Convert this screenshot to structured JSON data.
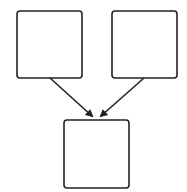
{
  "diagram": {
    "type": "flow",
    "stroke_color": "#222222",
    "background": "#ffffff",
    "nodes": [
      {
        "id": "top-left",
        "label": "",
        "x": 17,
        "y": 11,
        "w": 65,
        "h": 67
      },
      {
        "id": "top-right",
        "label": "",
        "x": 112,
        "y": 11,
        "w": 65,
        "h": 67
      },
      {
        "id": "bottom",
        "label": "",
        "x": 64,
        "y": 120,
        "w": 65,
        "h": 68
      }
    ],
    "edges": [
      {
        "from": "top-left",
        "to": "bottom",
        "x1": 50,
        "y1": 78,
        "x2": 92,
        "y2": 116
      },
      {
        "from": "top-right",
        "to": "bottom",
        "x1": 144,
        "y1": 78,
        "x2": 101,
        "y2": 116
      }
    ]
  }
}
